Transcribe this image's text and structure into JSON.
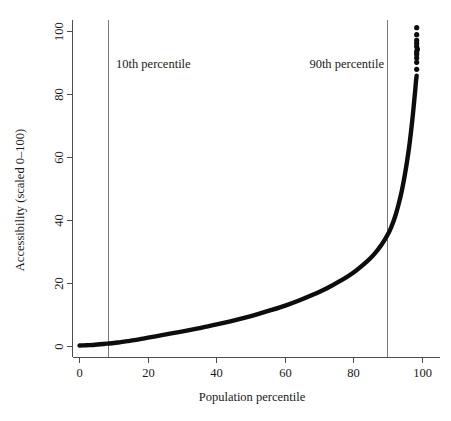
{
  "chart_data": {
    "type": "line",
    "title": "",
    "xlabel": "Population percentile",
    "ylabel": "Accessibility (scaled 0–100)",
    "xlim": [
      0,
      100
    ],
    "ylim": [
      0,
      100
    ],
    "grid": false,
    "legend": null,
    "xticks": [
      0,
      20,
      40,
      60,
      80,
      100
    ],
    "xtick_labels": [
      "0",
      "20",
      "40",
      "60",
      "80",
      "100"
    ],
    "yticks": [
      0,
      20,
      40,
      60,
      80,
      100
    ],
    "ytick_labels": [
      "0",
      "20",
      "40",
      "60",
      "80",
      "100"
    ],
    "series": [
      {
        "name": "Accessibility by population percentile",
        "x": [
          0,
          2,
          4,
          6,
          8,
          10,
          12,
          14,
          16,
          18,
          20,
          24,
          28,
          32,
          36,
          40,
          44,
          48,
          52,
          56,
          60,
          64,
          68,
          72,
          76,
          80,
          84,
          86,
          88,
          90,
          91,
          92,
          93,
          94,
          95,
          96,
          96.5,
          97,
          97.3,
          97.6,
          97.9,
          98.1,
          98.3
        ],
        "y": [
          0.3,
          0.4,
          0.5,
          0.7,
          0.9,
          1.1,
          1.4,
          1.7,
          2.0,
          2.4,
          2.8,
          3.6,
          4.4,
          5.2,
          6.1,
          7.0,
          8.0,
          9.1,
          10.3,
          11.6,
          13.0,
          14.6,
          16.4,
          18.4,
          20.8,
          23.6,
          27.2,
          29.4,
          32.2,
          35.8,
          38.2,
          41.2,
          45.0,
          49.6,
          55.4,
          62.5,
          66.8,
          71.6,
          74.8,
          78.2,
          81.6,
          84.2,
          86.0
        ]
      }
    ],
    "scatter_points": [
      {
        "x": 98.3,
        "y": 88.0
      },
      {
        "x": 98.3,
        "y": 90.2
      },
      {
        "x": 98.3,
        "y": 91.6
      },
      {
        "x": 98.3,
        "y": 92.8
      },
      {
        "x": 98.3,
        "y": 93.6
      },
      {
        "x": 98.5,
        "y": 94.4
      },
      {
        "x": 98.3,
        "y": 95.2
      },
      {
        "x": 98.3,
        "y": 96.2
      },
      {
        "x": 98.3,
        "y": 97.2
      },
      {
        "x": 98.3,
        "y": 99.0
      },
      {
        "x": 98.3,
        "y": 101.2
      }
    ],
    "annotations": [
      {
        "id": "p10",
        "label": "10th percentile",
        "x_value": 10,
        "type": "vertical-reference-line"
      },
      {
        "id": "p90",
        "label": "90th percentile",
        "x_value": 90,
        "type": "vertical-reference-line"
      }
    ],
    "colors": {
      "curve": "#0d0d0d",
      "reference_line": "#7a7a7a",
      "axis": "#4d4d4d",
      "background": "#ffffff",
      "text": "#1a1a1a"
    }
  }
}
